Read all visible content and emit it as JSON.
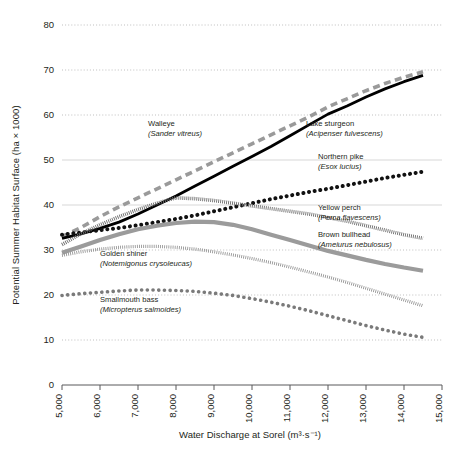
{
  "chart_data": {
    "type": "line",
    "title": "",
    "xlabel": "Water Discharge at Sorel (m³·s⁻¹)",
    "ylabel": "Potential Summer Habitat Surface (ha × 1000)",
    "xlim": [
      5000,
      15000
    ],
    "ylim": [
      0,
      80
    ],
    "grid": true,
    "legend_position": "inline-annotations",
    "xticks": [
      "5,000",
      "6,000",
      "7,000",
      "8,000",
      "9,000",
      "10,000",
      "11,000",
      "12,000",
      "13,000",
      "14,000",
      "15,000"
    ],
    "xtick_values": [
      5000,
      6000,
      7000,
      8000,
      9000,
      10000,
      11000,
      12000,
      13000,
      14000,
      15000
    ],
    "yticks": [
      "0",
      "10",
      "20",
      "30",
      "40",
      "50",
      "60",
      "70",
      "80"
    ],
    "ytick_values": [
      0,
      10,
      20,
      30,
      40,
      50,
      60,
      70,
      80
    ],
    "x": [
      5000,
      5500,
      6000,
      6500,
      7000,
      7500,
      8000,
      8500,
      9000,
      9500,
      10000,
      10500,
      11000,
      11500,
      12000,
      12500,
      13000,
      13500,
      14000,
      14500
    ],
    "series": [
      {
        "name": "Walleye",
        "latin": "Sander vitreus",
        "label": "Walleye (Sander vitreus)",
        "style": "dashed",
        "color": "#9a9a9a",
        "width": 3.6,
        "values": [
          33.0,
          35.0,
          37.4,
          39.6,
          41.6,
          43.6,
          45.6,
          47.6,
          49.6,
          51.6,
          53.6,
          55.6,
          57.6,
          59.6,
          61.8,
          63.6,
          65.4,
          67.0,
          68.4,
          69.6
        ]
      },
      {
        "name": "Lake sturgeon",
        "latin": "Acipenser fulvescens",
        "label": "Lake sturgeon (Acipenser fulvescens)",
        "style": "solid",
        "color": "#000000",
        "width": 2.8,
        "values": [
          32.6,
          33.6,
          34.8,
          36.2,
          38.0,
          40.0,
          42.0,
          44.2,
          46.4,
          48.6,
          50.8,
          53.0,
          55.4,
          57.8,
          60.2,
          62.0,
          64.0,
          65.8,
          67.4,
          68.8
        ]
      },
      {
        "name": "Northern pike",
        "latin": "Esox lucius",
        "label": "Northern pike (Esox lucius)",
        "style": "dotted-round",
        "color": "#111111",
        "width": 4.0,
        "values": [
          33.4,
          33.9,
          34.4,
          34.9,
          35.5,
          36.2,
          36.9,
          37.7,
          38.6,
          39.5,
          40.4,
          41.3,
          42.1,
          42.9,
          43.6,
          44.4,
          45.2,
          46.0,
          46.7,
          47.4
        ]
      },
      {
        "name": "Yellow perch",
        "latin": "Perca flavescens",
        "label": "Yellow perch (Perca flavescens)",
        "style": "hatched",
        "color": "#6e6e6e",
        "width": 3.6,
        "values": [
          31.2,
          33.6,
          35.6,
          37.4,
          39.0,
          40.4,
          41.6,
          41.4,
          41.0,
          40.4,
          39.8,
          39.2,
          38.6,
          38.0,
          37.2,
          36.4,
          35.4,
          34.4,
          33.4,
          32.6
        ]
      },
      {
        "name": "Brown bullhead",
        "latin": "Ameiurus nebulosus",
        "label": "Brown bullhead (Ameiurus nebulosus)",
        "style": "solid",
        "color": "#9b9b9b",
        "width": 4.2,
        "values": [
          29.4,
          30.8,
          32.2,
          33.5,
          34.6,
          35.4,
          36.0,
          36.3,
          36.2,
          35.6,
          34.6,
          33.4,
          32.2,
          31.0,
          29.8,
          28.8,
          27.8,
          26.9,
          26.1,
          25.4
        ]
      },
      {
        "name": "Golden shiner",
        "latin": "Notemigonus crysoleucas",
        "label": "Golden shiner (Notemigonus crysoleucas)",
        "style": "hatched-light",
        "color": "#8c8c8c",
        "width": 3.2,
        "values": [
          28.8,
          29.6,
          30.2,
          30.6,
          30.8,
          30.8,
          30.6,
          30.2,
          29.6,
          28.9,
          28.1,
          27.2,
          26.2,
          25.1,
          24.0,
          22.8,
          21.5,
          20.2,
          18.9,
          17.6
        ]
      },
      {
        "name": "Smallmouth bass",
        "latin": "Micropterus salmoides",
        "label": "Smallmouth bass (Micropterus salmoides)",
        "style": "dotted-round",
        "color": "#7a7a7a",
        "width": 3.6,
        "values": [
          19.9,
          20.3,
          20.6,
          20.9,
          21.1,
          21.1,
          21.0,
          20.8,
          20.4,
          19.9,
          19.2,
          18.4,
          17.5,
          16.5,
          15.4,
          14.3,
          13.2,
          12.2,
          11.3,
          10.6
        ]
      }
    ],
    "annotations": [
      {
        "id": "walleye",
        "name": "Walleye",
        "latin": "(Sander vitreus)",
        "x": 148,
        "y": 126
      },
      {
        "id": "lake-sturgeon",
        "name": "Lake sturgeon",
        "latin": "(Acipenser fulvescens)",
        "x": 306,
        "y": 126
      },
      {
        "id": "northern-pike",
        "name": "Northern pike",
        "latin": "(Esox lucius)",
        "x": 318,
        "y": 159
      },
      {
        "id": "yellow-perch",
        "name": "Yellow perch",
        "latin": "(Perca flavescens)",
        "x": 318,
        "y": 210
      },
      {
        "id": "brown-bullhead",
        "name": "Brown bullhead",
        "latin": "(Ameiurus nebulosus)",
        "x": 318,
        "y": 237
      },
      {
        "id": "golden-shiner",
        "name": "Golden shiner",
        "latin": "(Notemigonus crysoleucas)",
        "x": 100,
        "y": 256
      },
      {
        "id": "smallmouth-bass",
        "name": "Smallmouth bass",
        "latin": "(Micropterus salmoides)",
        "x": 100,
        "y": 302
      }
    ]
  }
}
